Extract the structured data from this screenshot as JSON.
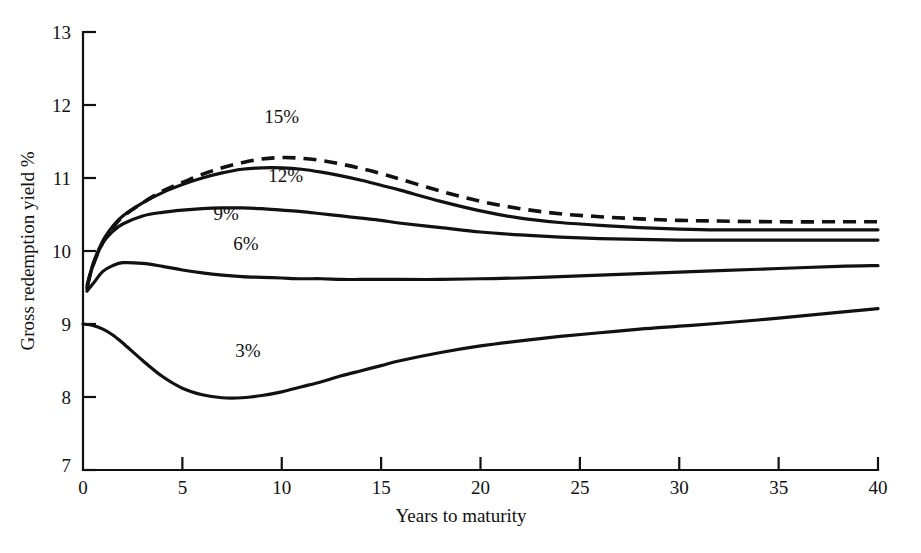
{
  "chart_data": {
    "type": "line",
    "title": "",
    "xlabel": "Years to maturity",
    "ylabel": "Gross redemption yield %",
    "xlim": [
      0,
      40
    ],
    "ylim": [
      7,
      13
    ],
    "xticks": [
      0,
      5,
      10,
      15,
      20,
      25,
      30,
      35,
      40
    ],
    "xtick_labels": [
      "0",
      "5",
      "10",
      "15",
      "20",
      "25",
      "30",
      "35",
      "40"
    ],
    "yticks": [
      7,
      8,
      9,
      10,
      11,
      12,
      13
    ],
    "ytick_labels": [
      "7",
      "8",
      "9",
      "10",
      "11",
      "12",
      "13"
    ],
    "grid": false,
    "legend_position": "inline-annotations",
    "series": [
      {
        "name": "15%",
        "label": "15%",
        "style": "dashed",
        "annotation": {
          "text": "15%",
          "x": 10.0,
          "y": 11.75
        },
        "x": [
          0.2,
          0.5,
          1.0,
          1.5,
          2.0,
          3.0,
          4.0,
          5.0,
          6.0,
          7.0,
          8.0,
          9.0,
          10.0,
          11.0,
          12.0,
          13.0,
          14.0,
          15.0,
          16.0,
          18.0,
          20.0,
          22.0,
          24.0,
          26.0,
          28.0,
          30.0,
          32.0,
          35.0,
          38.0,
          40.0
        ],
        "y": [
          9.52,
          9.8,
          10.12,
          10.32,
          10.47,
          10.66,
          10.82,
          10.94,
          11.05,
          11.14,
          11.21,
          11.26,
          11.28,
          11.27,
          11.24,
          11.19,
          11.13,
          11.06,
          10.98,
          10.82,
          10.68,
          10.58,
          10.51,
          10.47,
          10.44,
          10.42,
          10.41,
          10.4,
          10.4,
          10.4
        ]
      },
      {
        "name": "12%",
        "label": "12%",
        "style": "solid",
        "annotation": {
          "text": "12%",
          "x": 10.2,
          "y": 10.95
        },
        "x": [
          0.2,
          0.5,
          1.0,
          1.5,
          2.0,
          3.0,
          4.0,
          5.0,
          6.0,
          7.0,
          8.0,
          9.0,
          10.0,
          11.0,
          12.0,
          13.0,
          14.0,
          15.0,
          16.0,
          18.0,
          20.0,
          22.0,
          24.0,
          26.0,
          28.0,
          30.0,
          32.0,
          35.0,
          38.0,
          40.0
        ],
        "y": [
          9.5,
          9.82,
          10.14,
          10.34,
          10.48,
          10.66,
          10.8,
          10.91,
          11.0,
          11.07,
          11.12,
          11.14,
          11.14,
          11.12,
          11.08,
          11.03,
          10.97,
          10.9,
          10.83,
          10.68,
          10.55,
          10.45,
          10.39,
          10.35,
          10.32,
          10.3,
          10.29,
          10.29,
          10.29,
          10.29
        ]
      },
      {
        "name": "9%",
        "label": "9%",
        "style": "solid",
        "annotation": {
          "text": "9%",
          "x": 7.2,
          "y": 10.42
        },
        "x": [
          0.2,
          0.5,
          1.0,
          1.5,
          2.0,
          3.0,
          4.0,
          5.0,
          6.0,
          7.0,
          8.0,
          9.0,
          10.0,
          11.0,
          12.0,
          13.0,
          14.0,
          15.0,
          16.0,
          18.0,
          20.0,
          22.0,
          24.0,
          26.0,
          28.0,
          30.0,
          32.0,
          35.0,
          38.0,
          40.0
        ],
        "y": [
          9.48,
          9.8,
          10.11,
          10.27,
          10.37,
          10.48,
          10.53,
          10.56,
          10.58,
          10.59,
          10.59,
          10.58,
          10.56,
          10.54,
          10.51,
          10.48,
          10.45,
          10.42,
          10.38,
          10.32,
          10.26,
          10.22,
          10.19,
          10.17,
          10.16,
          10.15,
          10.15,
          10.15,
          10.15,
          10.15
        ]
      },
      {
        "name": "6%",
        "label": "6%",
        "style": "solid",
        "annotation": {
          "text": "6%",
          "x": 8.2,
          "y": 10.02
        },
        "x": [
          0.2,
          0.5,
          1.0,
          1.5,
          2.0,
          3.0,
          4.0,
          5.0,
          6.0,
          7.0,
          8.0,
          9.0,
          10.0,
          11.0,
          12.0,
          13.0,
          14.0,
          15.0,
          16.0,
          18.0,
          20.0,
          22.0,
          24.0,
          26.0,
          28.0,
          30.0,
          32.0,
          35.0,
          38.0,
          40.0
        ],
        "y": [
          9.45,
          9.55,
          9.72,
          9.8,
          9.84,
          9.83,
          9.79,
          9.74,
          9.7,
          9.67,
          9.65,
          9.64,
          9.63,
          9.62,
          9.62,
          9.61,
          9.61,
          9.61,
          9.61,
          9.61,
          9.62,
          9.63,
          9.65,
          9.67,
          9.69,
          9.71,
          9.73,
          9.76,
          9.79,
          9.8
        ]
      },
      {
        "name": "3%",
        "label": "3%",
        "style": "solid",
        "annotation": {
          "text": "3%",
          "x": 8.3,
          "y": 8.55
        },
        "x": [
          0.0,
          0.5,
          1.0,
          1.5,
          2.0,
          3.0,
          4.0,
          5.0,
          6.0,
          7.0,
          8.0,
          9.0,
          10.0,
          11.0,
          12.0,
          13.0,
          14.0,
          15.0,
          16.0,
          18.0,
          20.0,
          22.0,
          24.0,
          26.0,
          28.0,
          30.0,
          32.0,
          35.0,
          38.0,
          40.0
        ],
        "y": [
          9.0,
          8.98,
          8.93,
          8.85,
          8.74,
          8.5,
          8.28,
          8.12,
          8.03,
          7.99,
          7.99,
          8.02,
          8.07,
          8.14,
          8.21,
          8.29,
          8.36,
          8.43,
          8.5,
          8.61,
          8.7,
          8.77,
          8.83,
          8.88,
          8.93,
          8.97,
          9.01,
          9.08,
          9.16,
          9.21
        ]
      }
    ]
  },
  "figure": {
    "background_color": "#ffffff",
    "ink_color": "#111111"
  }
}
